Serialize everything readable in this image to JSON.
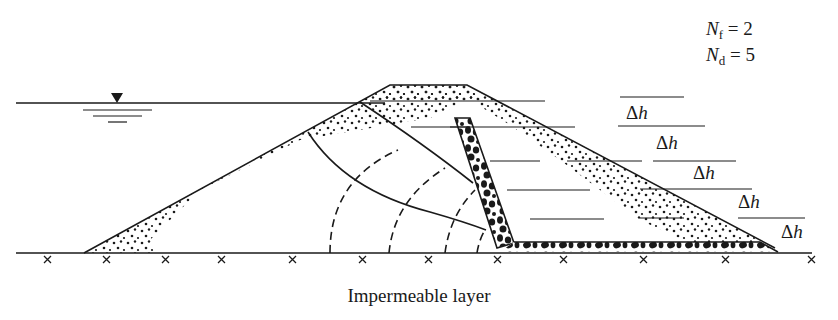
{
  "figure": {
    "legend": {
      "nf": {
        "symbol": "N",
        "subscript": "f",
        "equals": "= 2"
      },
      "nd": {
        "symbol": "N",
        "subscript": "d",
        "equals": "= 5"
      }
    },
    "head_drop_labels": [
      {
        "delta": "Δ",
        "var": "h"
      },
      {
        "delta": "Δ",
        "var": "h"
      },
      {
        "delta": "Δ",
        "var": "h"
      },
      {
        "delta": "Δ",
        "var": "h"
      },
      {
        "delta": "Δ",
        "var": "h"
      }
    ],
    "caption": "Impermeable layer",
    "elements": [
      "upstream water level with free-surface symbol",
      "earth dam with sandy shells",
      "inclined chimney drain (gravel)",
      "horizontal blanket drain (gravel)",
      "flow lines (solid)",
      "equipotential lines (dashed)",
      "impermeable base marked with crosses"
    ],
    "colors": {
      "ink": "#1a1a1a",
      "background": "#ffffff"
    }
  }
}
